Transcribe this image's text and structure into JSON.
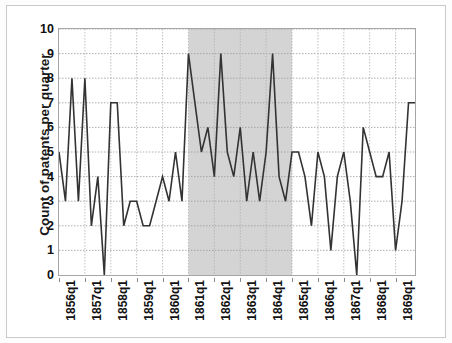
{
  "chart_data": {
    "type": "line",
    "title": "",
    "xlabel": "",
    "ylabel": "Count of patents per quarter",
    "ylim": [
      0,
      10
    ],
    "yticks": [
      0,
      1,
      2,
      3,
      4,
      5,
      6,
      7,
      8,
      9,
      10
    ],
    "grid": true,
    "legend": "none",
    "line_color": "#333333",
    "shaded_region": {
      "label": "",
      "from": "1861q1",
      "to": "1865q1",
      "color": "#d4d4d4"
    },
    "x_tick_labels": [
      "1856q1",
      "1857q1",
      "1858q1",
      "1859q1",
      "1860q1",
      "1861q1",
      "1862q1",
      "1863q1",
      "1864q1",
      "1865q1",
      "1866q1",
      "1867q1",
      "1868q1",
      "1869q1"
    ],
    "x": [
      "1856q1",
      "1856q2",
      "1856q3",
      "1856q4",
      "1857q1",
      "1857q2",
      "1857q3",
      "1857q4",
      "1858q1",
      "1858q2",
      "1858q3",
      "1858q4",
      "1859q1",
      "1859q2",
      "1859q3",
      "1859q4",
      "1860q1",
      "1860q2",
      "1860q3",
      "1860q4",
      "1861q1",
      "1861q2",
      "1861q3",
      "1861q4",
      "1862q1",
      "1862q2",
      "1862q3",
      "1862q4",
      "1863q1",
      "1863q2",
      "1863q3",
      "1863q4",
      "1864q1",
      "1864q2",
      "1864q3",
      "1864q4",
      "1865q1",
      "1865q2",
      "1865q3",
      "1865q4",
      "1866q1",
      "1866q2",
      "1866q3",
      "1866q4",
      "1867q1",
      "1867q2",
      "1867q3",
      "1867q4",
      "1868q1",
      "1868q2",
      "1868q3",
      "1868q4",
      "1869q1",
      "1869q2",
      "1869q3",
      "1869q4"
    ],
    "values": [
      5,
      3,
      8,
      3,
      8,
      2,
      4,
      0,
      7,
      7,
      2,
      3,
      3,
      2,
      2,
      3,
      4,
      3,
      5,
      3,
      9,
      7,
      5,
      6,
      4,
      9,
      5,
      4,
      6,
      3,
      5,
      3,
      5,
      9,
      4,
      3,
      5,
      5,
      4,
      2,
      5,
      4,
      1,
      4,
      5,
      3,
      0,
      6,
      5,
      4,
      4,
      5,
      1,
      3,
      7,
      7
    ],
    "values_note": "Quarterly patent counts, 1856q1-1869q4"
  },
  "axes": {
    "y_label": "Count of patents per quarter",
    "y_tick_labels": [
      "10",
      "9",
      "8",
      "7",
      "6",
      "5",
      "4",
      "3",
      "2",
      "1",
      "0"
    ]
  }
}
